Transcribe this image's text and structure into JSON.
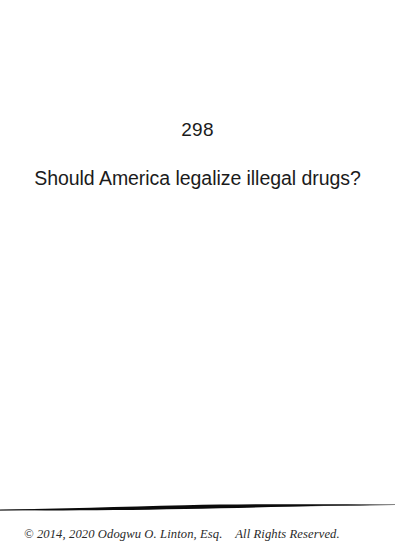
{
  "document": {
    "type": "scanned-book-page",
    "background_color": "#ffffff",
    "text_color": "#1b1b1b"
  },
  "page": {
    "number": "298"
  },
  "content": {
    "question": "Should America legalize illegal drugs?"
  },
  "divider": {
    "name": "tapered-rule",
    "color": "#0b0b0b"
  },
  "footer": {
    "copyright": "© 2014, 2020 Odogwu O. Linton, Esq.    All Rights Reserved.",
    "color": "#2a2a2a"
  }
}
